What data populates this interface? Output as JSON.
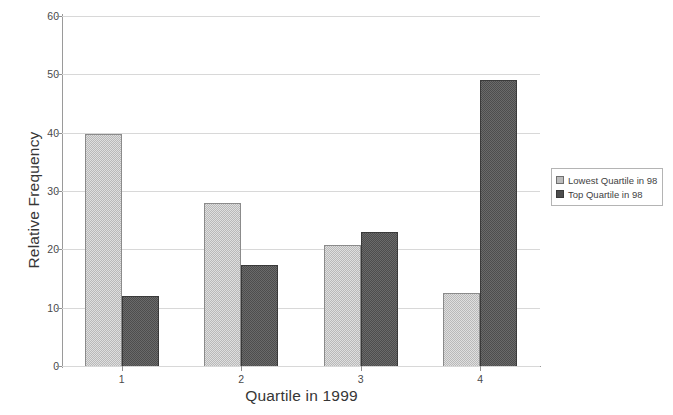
{
  "chart_data": {
    "type": "bar",
    "title": "",
    "xlabel": "Quartile in 1999",
    "ylabel": "Relative Frequency",
    "categories": [
      "1",
      "2",
      "3",
      "4"
    ],
    "series": [
      {
        "name": "Lowest Quartile in 98",
        "color": "#b9b9b9",
        "values": [
          39.8,
          28.0,
          20.8,
          12.5
        ]
      },
      {
        "name": "Top Quartile in 98",
        "color": "#4d4d4d",
        "values": [
          12.0,
          17.3,
          23.0,
          49.0
        ]
      }
    ],
    "ylim": [
      0,
      60
    ],
    "yticks": [
      0,
      10,
      20,
      30,
      40,
      50,
      60
    ],
    "grid": true,
    "legend_position": "right"
  },
  "axes": {
    "y_title": "Relative Frequency",
    "x_title": "Quartile in 1999"
  },
  "legend": {
    "entries": [
      {
        "label": "Lowest Quartile in 98"
      },
      {
        "label": "Top Quartile in 98"
      }
    ]
  }
}
